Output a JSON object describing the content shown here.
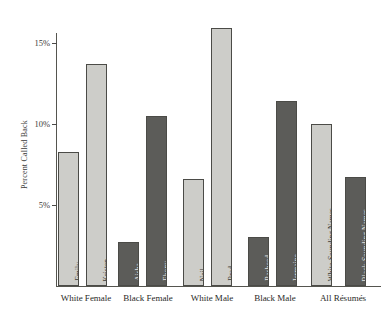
{
  "chart_data": {
    "type": "bar",
    "title": "",
    "xlabel": "",
    "ylabel": "Percent Called Back",
    "ylim": [
      0,
      17
    ],
    "grid": false,
    "legend": "none",
    "ytick_labels": [
      "15%",
      "10%",
      "5%"
    ],
    "ytick_values": [
      15,
      10,
      5
    ],
    "categories": [
      "White Female",
      "Black Female",
      "White Male",
      "Black Male",
      "All Résumés"
    ],
    "bars": [
      {
        "label": "Emily",
        "value": 8.3,
        "group": "White Female",
        "shade": "light"
      },
      {
        "label": "Kristen",
        "value": 13.7,
        "group": "White Female",
        "shade": "light"
      },
      {
        "label": "Aisha",
        "value": 2.7,
        "group": "Black Female",
        "shade": "dark"
      },
      {
        "label": "Ebony",
        "value": 10.5,
        "group": "Black Female",
        "shade": "dark"
      },
      {
        "label": "Neil",
        "value": 6.6,
        "group": "White Male",
        "shade": "light"
      },
      {
        "label": "Brad",
        "value": 15.9,
        "group": "White Male",
        "shade": "light"
      },
      {
        "label": "Rasheed",
        "value": 3.0,
        "group": "Black Male",
        "shade": "dark"
      },
      {
        "label": "Jermaine",
        "value": 11.4,
        "group": "Black Male",
        "shade": "dark"
      },
      {
        "label": "White-Sounding Names",
        "value": 10.0,
        "group": "All Résumés",
        "shade": "light"
      },
      {
        "label": "Black-Sounding Names",
        "value": 6.7,
        "group": "All Résumés",
        "shade": "dark"
      }
    ],
    "colors": {
      "light_bar": "#cdcdc9",
      "dark_bar": "#5c5c59",
      "bar_border": "#4b4b47",
      "axis": "#55554f",
      "background": "#ffffff",
      "text": "#2a2a28"
    }
  },
  "layout": {
    "baseline_y": 286,
    "pixels_per_percent": 16.2,
    "bar_width": 21,
    "bar_x": [
      58,
      86,
      118,
      146,
      183,
      211,
      248,
      276,
      311,
      345
    ],
    "category_center_x": [
      86,
      148,
      212,
      275,
      343
    ]
  }
}
